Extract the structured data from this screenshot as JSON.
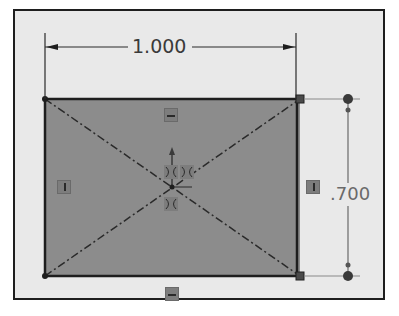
{
  "sketch": {
    "width_dimension": "1.000",
    "height_dimension": ".700",
    "relations": {
      "top_edge": "horizontal",
      "bottom_edge": "horizontal",
      "left_edge": "vertical",
      "right_edge": "vertical",
      "center": [
        "coincident",
        "coincident",
        "coincident"
      ]
    },
    "colors": {
      "background": "#e9e9e9",
      "fill": "#8c8c8c",
      "edge": "#1e1e1e",
      "relation_badge": "#7d7d7d"
    }
  }
}
